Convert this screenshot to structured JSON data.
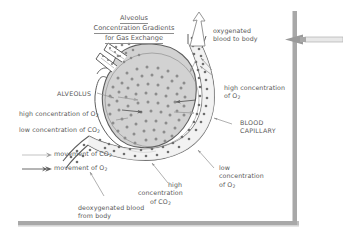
{
  "document": {
    "title_lines": [
      "Alveolus",
      "Concentration Gradients",
      "for Gas Exchange"
    ]
  },
  "labels": {
    "oxygenated_blood": [
      "oxygenated",
      "blood to body"
    ],
    "high_conc_o2_right": [
      "high concentration",
      "of O"
    ],
    "alveolus": "ALVEOLUS",
    "high_conc_o2_left": "high concentration of O",
    "low_conc_co2_left": "low concentration of CO",
    "blood_capillary": [
      "BLOOD",
      "CAPILLARY"
    ],
    "low_conc_o2_right": [
      "low",
      "concentration",
      "of O"
    ],
    "high_conc_co2_bottom": [
      "high",
      "concentration",
      "of CO"
    ],
    "deoxygenated_blood": [
      "deoxygenated blood",
      "from body"
    ],
    "subscript_2": "2"
  },
  "legend": {
    "items": [
      {
        "name": "movement-of-co2",
        "label": "movement of CO",
        "sub": "2",
        "style": "light"
      },
      {
        "name": "movement-of-o2",
        "label": "movement of O",
        "sub": "2",
        "style": "dark"
      }
    ]
  },
  "colors": {
    "ink": "#575757",
    "alveolus_fill": "#d2d2d2",
    "alveolus_dots": "#8c8c8c",
    "capillary_fill": "#f0f0f0",
    "capillary_dots": "#6e6e6e",
    "stroke": "#5e5e5e",
    "border_bar": "#a8a8a8",
    "pointer_arrow": "#9a9a9a",
    "background": "#ffffff"
  },
  "annotation": {
    "pointer_direction": "left",
    "name": "scroll-pointer-arrow"
  }
}
